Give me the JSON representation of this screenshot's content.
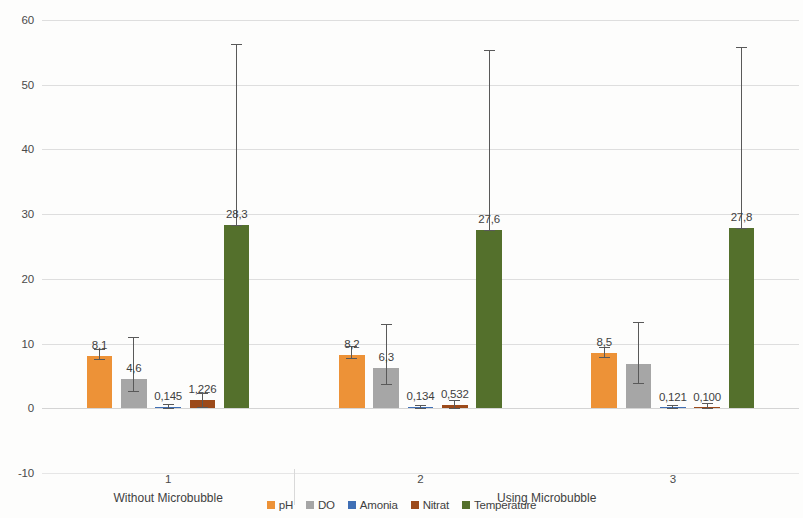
{
  "chart_data": {
    "type": "bar",
    "title": "",
    "xlabel": "",
    "ylabel": "",
    "ylim": [
      -10,
      60
    ],
    "ytick_values": [
      60,
      50,
      40,
      30,
      20,
      10,
      0,
      -10
    ],
    "ytick_labels": [
      "60",
      "50",
      "40",
      "30",
      "20",
      "10",
      "0",
      "-10"
    ],
    "grid": true,
    "legend_position": "bottom",
    "categories": [
      "1",
      "2",
      "3"
    ],
    "category_groups": [
      {
        "label": "Without Microbubble",
        "categories": [
          "1"
        ]
      },
      {
        "label": "Using Microbubble",
        "categories": [
          "2",
          "3"
        ]
      }
    ],
    "series": [
      {
        "name": "pH",
        "color": "#ED9237",
        "values": [
          8.1,
          8.2,
          8.5
        ],
        "labels": [
          "8,1",
          "8,2",
          "8,5"
        ],
        "err_low": [
          7.6,
          7.7,
          8.0
        ],
        "err_high": [
          9.1,
          9.6,
          9.5
        ]
      },
      {
        "name": "DO",
        "color": "#A6A6A6",
        "values": [
          4.6,
          6.3,
          6.8
        ],
        "labels": [
          "4,6",
          "6,3",
          ""
        ],
        "err_low": [
          2.6,
          3.7,
          3.9
        ],
        "err_high": [
          11.0,
          13.0,
          13.3
        ]
      },
      {
        "name": "Amonia",
        "color": "#3F6FB5",
        "values": [
          0.145,
          0.134,
          0.121
        ],
        "labels": [
          "0,145",
          "0,134",
          "0,121"
        ],
        "err_low": [
          0.0,
          0.0,
          0.0
        ],
        "err_high": [
          0.6,
          0.5,
          0.5
        ]
      },
      {
        "name": "Nitrat",
        "color": "#9C4A1A",
        "values": [
          1.226,
          0.532,
          0.1
        ],
        "labels": [
          "1,226",
          "0,532",
          "0,100"
        ],
        "err_low": [
          0.2,
          0.0,
          0.0
        ],
        "err_high": [
          2.4,
          1.3,
          0.8
        ]
      },
      {
        "name": "Temperature",
        "color": "#54702C",
        "values": [
          28.3,
          27.6,
          27.8
        ],
        "labels": [
          "28,3",
          "27,6",
          "27,8"
        ],
        "err_low": [
          28.3,
          27.6,
          27.8
        ],
        "err_high": [
          56.3,
          55.4,
          55.9
        ]
      }
    ]
  },
  "legend": {
    "items": [
      {
        "label": "pH",
        "color": "#ED9237"
      },
      {
        "label": "DO",
        "color": "#A6A6A6"
      },
      {
        "label": "Amonia",
        "color": "#3F6FB5"
      },
      {
        "label": "Nitrat",
        "color": "#9C4A1A"
      },
      {
        "label": "Temperature",
        "color": "#54702C"
      }
    ]
  }
}
